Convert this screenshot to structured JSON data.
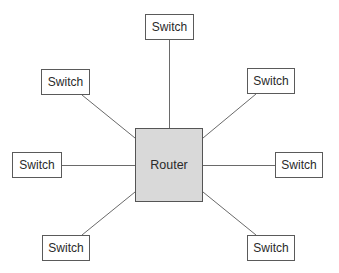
{
  "diagram": {
    "type": "star-topology",
    "center": {
      "label": "Router",
      "fill": "#d9d9d9",
      "border": "#555555"
    },
    "nodes": [
      {
        "id": "top",
        "label": "Switch"
      },
      {
        "id": "top-left",
        "label": "Switch"
      },
      {
        "id": "top-right",
        "label": "Switch"
      },
      {
        "id": "left",
        "label": "Switch"
      },
      {
        "id": "right",
        "label": "Switch"
      },
      {
        "id": "bottom-left",
        "label": "Switch"
      },
      {
        "id": "bottom-right",
        "label": "Switch"
      }
    ],
    "edges": [
      {
        "from": "Router",
        "to": "top"
      },
      {
        "from": "Router",
        "to": "top-left"
      },
      {
        "from": "Router",
        "to": "top-right"
      },
      {
        "from": "Router",
        "to": "left"
      },
      {
        "from": "Router",
        "to": "right"
      },
      {
        "from": "Router",
        "to": "bottom-left"
      },
      {
        "from": "Router",
        "to": "bottom-right"
      }
    ]
  }
}
